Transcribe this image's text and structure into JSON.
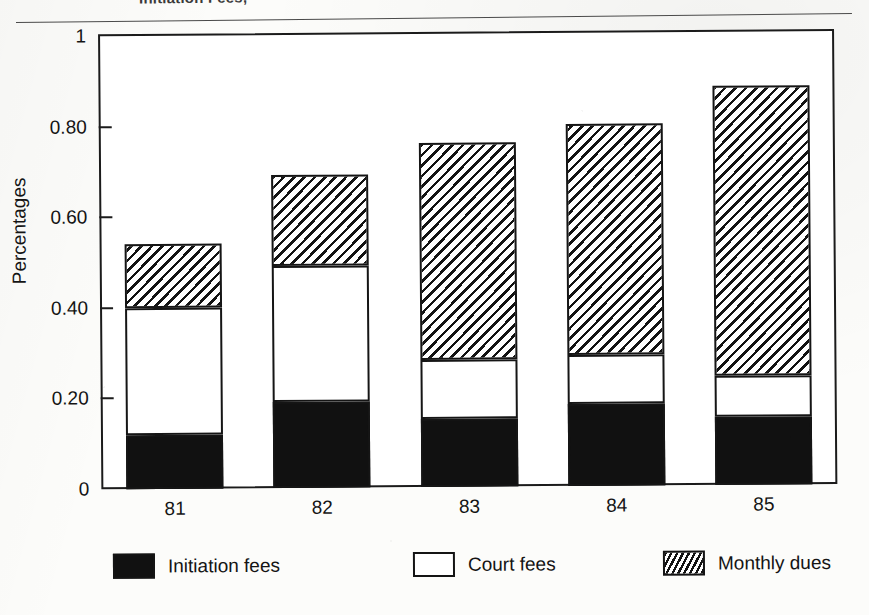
{
  "page": {
    "cropped_title": "Initiation Fees,"
  },
  "chart_data": {
    "type": "bar",
    "subtype": "stacked-bar",
    "title": "Initiation Fees,",
    "xlabel": "",
    "ylabel": "Percentages",
    "categories": [
      "81",
      "82",
      "83",
      "84",
      "85"
    ],
    "series": [
      {
        "name": "Initiation fees",
        "fill": "solid-black",
        "color": "#111111",
        "values": [
          0.12,
          0.19,
          0.15,
          0.18,
          0.15
        ]
      },
      {
        "name": "Court fees",
        "fill": "white-outline",
        "color": "#ffffff",
        "values": [
          0.28,
          0.3,
          0.13,
          0.11,
          0.09
        ]
      },
      {
        "name": "Monthly dues",
        "fill": "diagonal-hatch",
        "color": "#131313",
        "values": [
          0.14,
          0.2,
          0.48,
          0.51,
          0.64
        ]
      }
    ],
    "cumulative_tops": [
      {
        "category": "81",
        "initiation": 0.12,
        "initiation_plus_court": 0.4,
        "total": 0.545
      },
      {
        "category": "82",
        "initiation": 0.19,
        "initiation_plus_court": 0.49,
        "total": 0.69
      },
      {
        "category": "83",
        "initiation": 0.15,
        "initiation_plus_court": 0.28,
        "total": 0.765
      },
      {
        "category": "84",
        "initiation": 0.18,
        "initiation_plus_court": 0.29,
        "total": 0.8
      },
      {
        "category": "85",
        "initiation": 0.15,
        "initiation_plus_court": 0.24,
        "total": 0.88
      }
    ],
    "ylim": [
      0,
      1
    ],
    "ytick_labels": [
      "1",
      "0.80",
      "0.60",
      "0.40",
      "0.20",
      "0"
    ],
    "ytick_values": [
      1,
      0.8,
      0.6,
      0.4,
      0.2,
      0
    ],
    "grid": false,
    "legend_position": "bottom"
  },
  "legend": {
    "items": [
      {
        "label": "Initiation fees",
        "swatch": "solid-black"
      },
      {
        "label": "Court fees",
        "swatch": "white-outline"
      },
      {
        "label": "Monthly dues",
        "swatch": "diagonal-hatch"
      }
    ]
  }
}
